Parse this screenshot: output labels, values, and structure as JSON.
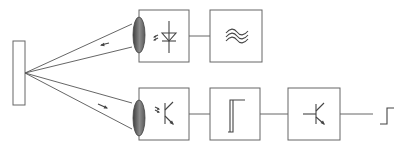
{
  "diagram": {
    "colors": {
      "line": "#555555",
      "box": "#666666",
      "lens_dark": "#555555",
      "lens_light": "#bdbdbd",
      "background": "#ffffff"
    },
    "components": [
      {
        "id": "reflector",
        "type": "target-plate"
      },
      {
        "id": "emitter-lens",
        "type": "lens"
      },
      {
        "id": "emitter-led",
        "type": "box",
        "symbol": "light-emitting-diode"
      },
      {
        "id": "oscillator",
        "type": "box",
        "symbol": "ac-wave"
      },
      {
        "id": "receiver-lens",
        "type": "lens"
      },
      {
        "id": "receiver-phototransistor",
        "type": "box",
        "symbol": "phototransistor"
      },
      {
        "id": "schmitt-trigger",
        "type": "box",
        "symbol": "hysteresis"
      },
      {
        "id": "output-transistor",
        "type": "box",
        "symbol": "transistor"
      },
      {
        "id": "output-signal",
        "type": "signal",
        "symbol": "step-edge"
      }
    ],
    "connections": [
      [
        "emitter-led",
        "oscillator"
      ],
      [
        "receiver-phototransistor",
        "schmitt-trigger"
      ],
      [
        "schmitt-trigger",
        "output-transistor"
      ],
      [
        "output-transistor",
        "output-signal"
      ]
    ],
    "light_paths": [
      {
        "from": "emitter-lens",
        "to": "reflector",
        "direction": "outgoing"
      },
      {
        "from": "reflector",
        "to": "receiver-lens",
        "direction": "reflected"
      }
    ]
  }
}
